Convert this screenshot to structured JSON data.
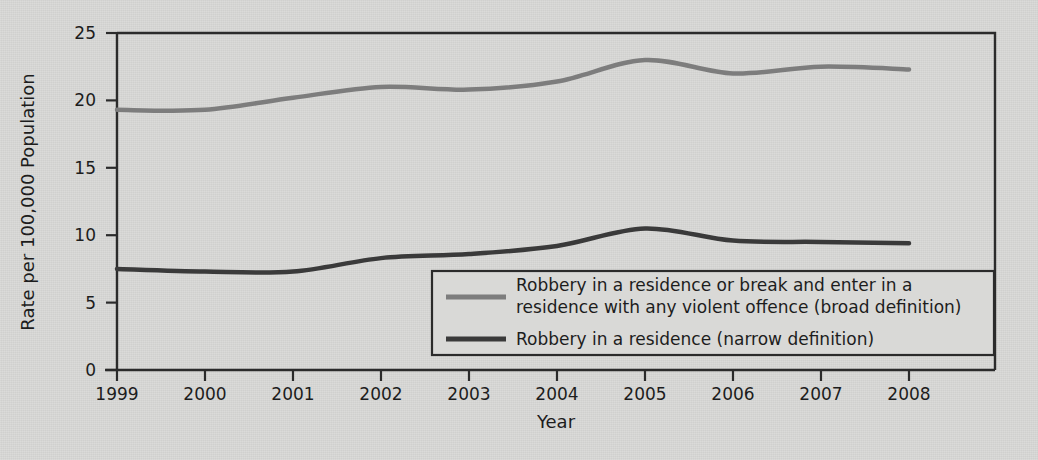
{
  "chart_data": {
    "type": "line",
    "title": "",
    "xlabel": "Year",
    "ylabel": "Rate per 100,000 Population",
    "x": [
      1999,
      2000,
      2001,
      2002,
      2003,
      2004,
      2005,
      2006,
      2007,
      2008
    ],
    "xtick_labels": [
      "1999",
      "2000",
      "2001",
      "2002",
      "2003",
      "2004",
      "2005",
      "2006",
      "2007",
      "2008"
    ],
    "ytick_labels": [
      "0",
      "5",
      "10",
      "15",
      "20",
      "25"
    ],
    "yticks": [
      0,
      5,
      10,
      15,
      20,
      25
    ],
    "ylim": [
      0,
      25
    ],
    "xlim": [
      1998.6,
      2008.6
    ],
    "grid": false,
    "legend_position": "lower-right-inside",
    "series": [
      {
        "name": "Robbery in a residence or break and enter in a residence with any violent offence (broad definition)",
        "legend_label_line1": "Robbery in a residence or break and enter in a",
        "legend_label_line2": "residence with any violent offence (broad definition)",
        "color": "#7d7d7d",
        "width": 4.5,
        "values": [
          19.3,
          19.3,
          20.2,
          21.0,
          20.8,
          21.4,
          23.0,
          22.0,
          22.5,
          22.3
        ]
      },
      {
        "name": "Robbery in a residence (narrow definition)",
        "legend_label_line1": "Robbery in a residence (narrow definition)",
        "legend_label_line2": "",
        "color": "#3a3a3a",
        "width": 4.5,
        "values": [
          7.5,
          7.3,
          7.3,
          8.3,
          8.6,
          9.2,
          10.5,
          9.6,
          9.5,
          9.4
        ]
      }
    ]
  },
  "figure": {
    "background_color": "#d9d9d7",
    "axis_color": "#2b2b2b"
  }
}
